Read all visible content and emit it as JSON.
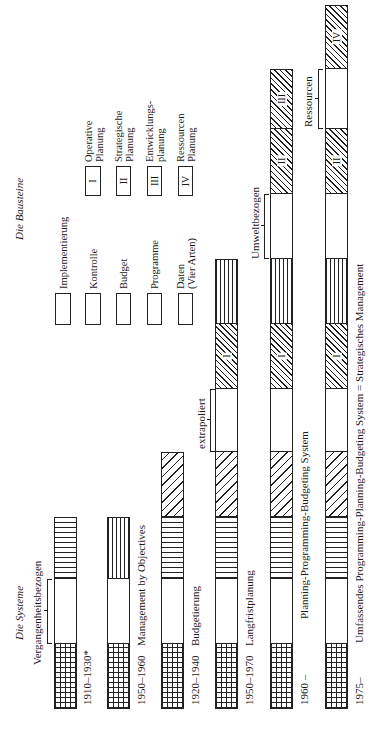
{
  "titles": {
    "systems": "Die Systeme",
    "building_blocks": "Die Bausteine",
    "past_related": "Vergangenheitsbezogen"
  },
  "legend": {
    "building_blocks": [
      {
        "key": "impl",
        "label": "Implementierung"
      },
      {
        "key": "kontrolle",
        "label": "Kontrolle"
      },
      {
        "key": "budget",
        "label": "Budget"
      },
      {
        "key": "programme",
        "label": "Programme"
      },
      {
        "key": "data",
        "label": "Daten",
        "label2": "(Vier Arten)"
      }
    ],
    "planning": [
      {
        "roman": "I",
        "label": "Operative",
        "label2": "Planung"
      },
      {
        "roman": "II",
        "label": "Strategische",
        "label2": "Planung"
      },
      {
        "roman": "III",
        "label": "Entwicklungs-",
        "label2": "planung"
      },
      {
        "roman": "IV",
        "label": "Ressourcen",
        "label2": "Planung"
      }
    ]
  },
  "systems": [
    {
      "period": "1910–1930*",
      "name": "",
      "segments": [
        "impl",
        "data",
        "kontrolle"
      ]
    },
    {
      "period": "1950–1960",
      "name": "Management by Objectives",
      "segments": [
        "impl",
        "data",
        "programme"
      ]
    },
    {
      "period": "1920–1940",
      "name": "Budgetierung",
      "segments": [
        "impl",
        "data",
        "kontrolle",
        "budget"
      ]
    },
    {
      "period": "1950–1970",
      "name": "Langfristplanung",
      "segments": [
        "impl",
        "data",
        "kontrolle",
        "budget",
        "data",
        "I",
        "programme"
      ]
    },
    {
      "period": "1960 –",
      "name": "Planning-Programming-Budgeting System",
      "segments": [
        "impl",
        "data",
        "kontrolle",
        "budget",
        "data",
        "I",
        "programme",
        "data",
        "II",
        "III"
      ]
    },
    {
      "period": "1975–",
      "name": "Umfassendes Programming-Planning-Budgeting System = Strategisches Management",
      "segments": [
        "impl",
        "data",
        "kontrolle",
        "budget",
        "data",
        "I",
        "programme",
        "data",
        "II",
        "data",
        "IV"
      ]
    }
  ],
  "annotations": {
    "extrapolated": "extrapoliert",
    "environment_related": "Umweltbezogen",
    "resources": "Ressourcen"
  },
  "roman": {
    "I": "I",
    "II": "II",
    "III": "III",
    "IV": "IV"
  }
}
